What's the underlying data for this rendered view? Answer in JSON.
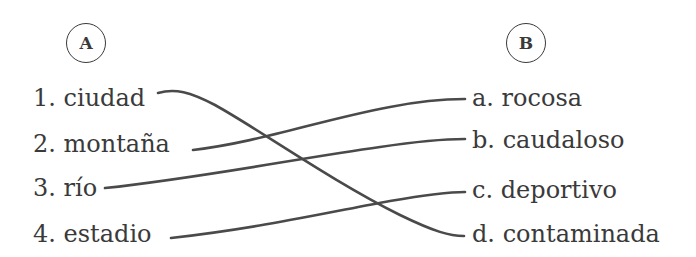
{
  "column_a": {
    "label": "A",
    "items": [
      {
        "number": "1.",
        "text": "ciudad"
      },
      {
        "number": "2.",
        "text": "montaña"
      },
      {
        "number": "3.",
        "text": "río"
      },
      {
        "number": "4.",
        "text": "estadio"
      }
    ]
  },
  "column_b": {
    "label": "B",
    "items": [
      {
        "letter": "a.",
        "text": "rocosa"
      },
      {
        "letter": "b.",
        "text": "caudaloso"
      },
      {
        "letter": "c.",
        "text": "deportivo"
      },
      {
        "letter": "d.",
        "text": "contaminada"
      }
    ]
  },
  "matches": [
    {
      "from": "1. ciudad",
      "to": "d. contaminada"
    },
    {
      "from": "2. montaña",
      "to": "a. rocosa"
    },
    {
      "from": "3. río",
      "to": "b. caudaloso"
    },
    {
      "from": "4. estadio",
      "to": "c. deportivo"
    }
  ]
}
